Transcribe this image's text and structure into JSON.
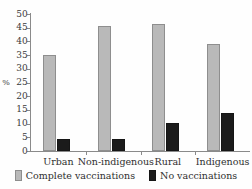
{
  "chart_data": {
    "type": "bar",
    "title": "",
    "subtitle": "",
    "xlabel": "",
    "ylabel": "%",
    "categories": [
      "Urban",
      "Non-indigenous",
      "Rural",
      "Indigenous"
    ],
    "series": [
      {
        "name": "Complete vaccinations",
        "color": "#b9b9b9",
        "values": [
          35,
          45.5,
          46.5,
          39
        ]
      },
      {
        "name": "No vaccinations",
        "color": "#1b1b1b",
        "values": [
          4.5,
          4.5,
          10.3,
          14
        ]
      }
    ],
    "ylim": [
      0,
      50
    ],
    "yticks": [
      0,
      5,
      10,
      15,
      20,
      25,
      30,
      35,
      40,
      45,
      50
    ],
    "ytick_labels": [
      "0",
      "5",
      "10",
      "15",
      "20",
      "25",
      "30",
      "35",
      "40",
      "45",
      "50"
    ],
    "grid": false,
    "legend_position": "bottom"
  }
}
